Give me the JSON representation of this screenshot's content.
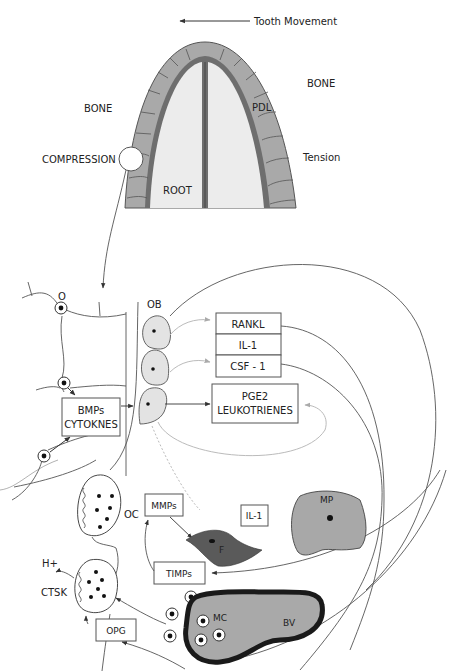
{
  "top_figure": {
    "direction_label": "Tooth Movement",
    "labels": {
      "bone_left": "BONE",
      "bone_right": "BONE",
      "pdl": "PDL",
      "compression": "COMPRESSION",
      "tension": "Tension",
      "root": "ROOT"
    }
  },
  "bottom_figure": {
    "cells": {
      "osteocyte": "O",
      "osteoblast": "OB",
      "osteoclast": "OC",
      "fibroblast": "F",
      "macrophage": "MP",
      "mast_cell": "MC",
      "blood_vessel": "BV"
    },
    "boxes": {
      "rankl": "RANKL",
      "il1_stack": "IL-1",
      "csf1": "CSF - 1",
      "pge2": "PGE2",
      "leukotrienes": "LEUKOTRIENES",
      "bmps": "BMPs",
      "cytokines": "CYTOKNES",
      "mmps": "MMPs",
      "il1": "IL-1",
      "timps": "TIMPs",
      "opg": "OPG"
    },
    "labels": {
      "h_plus": "H+",
      "ctsk": "CTSK"
    }
  },
  "colors": {
    "bone_gray": "#a9a9a9",
    "pdl_dark": "#6e6e6e",
    "root_light": "#ececec",
    "cell_light": "#e3e3e3",
    "fibroblast": "#5a5a5a",
    "macrophage": "#a8a8a8",
    "vessel_border": "#1a1a1a"
  }
}
